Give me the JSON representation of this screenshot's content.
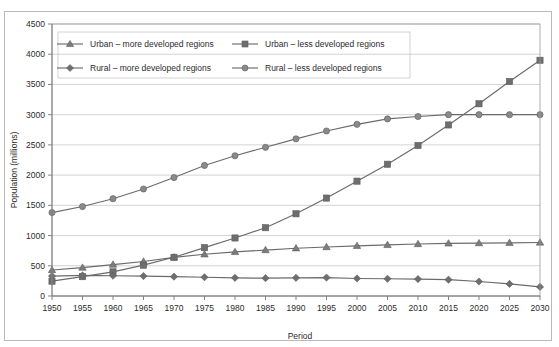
{
  "chart_data": {
    "type": "line",
    "title": "",
    "xlabel": "Period",
    "ylabel": "Population (millions)",
    "x": [
      1950,
      1955,
      1960,
      1965,
      1970,
      1975,
      1980,
      1985,
      1990,
      1995,
      2000,
      2005,
      2010,
      2015,
      2020,
      2025,
      2030
    ],
    "xticklabels": [
      "1950",
      "1955",
      "1960",
      "1965",
      "1970",
      "1975",
      "1980",
      "1985",
      "1990",
      "1995",
      "2000",
      "2005",
      "2010",
      "2015",
      "2020",
      "2025",
      "2030"
    ],
    "yticklabels": [
      "0",
      "500",
      "1000",
      "1500",
      "2000",
      "2500",
      "3000",
      "3500",
      "4000",
      "4500"
    ],
    "yticks": [
      0,
      500,
      1000,
      1500,
      2000,
      2500,
      3000,
      3500,
      4000,
      4500
    ],
    "ylim": [
      0,
      4500
    ],
    "xlim": [
      1950,
      2030
    ],
    "grid": "horizontal",
    "legend_position": "top-left-inside",
    "series": [
      {
        "name": "Urban – more developed regions",
        "marker": "triangle",
        "color": "#7d7d7d",
        "values": [
          430,
          470,
          520,
          570,
          640,
          690,
          730,
          760,
          790,
          810,
          830,
          845,
          860,
          870,
          875,
          880,
          885
        ]
      },
      {
        "name": "Urban – less developed regions",
        "marker": "square",
        "color": "#6e6e6e",
        "values": [
          245,
          320,
          400,
          510,
          640,
          800,
          960,
          1130,
          1360,
          1620,
          1900,
          2180,
          2490,
          2830,
          3180,
          3550,
          3900
        ]
      },
      {
        "name": "Rural – more developed regions",
        "marker": "diamond",
        "color": "#6e6e6e",
        "values": [
          330,
          340,
          335,
          330,
          320,
          310,
          300,
          295,
          300,
          305,
          290,
          285,
          280,
          270,
          240,
          200,
          150
        ]
      },
      {
        "name": "Rural – less developed regions",
        "marker": "circle",
        "color": "#8a8a8a",
        "values": [
          1380,
          1480,
          1610,
          1770,
          1960,
          2160,
          2320,
          2460,
          2600,
          2730,
          2840,
          2930,
          2970,
          3000,
          3000,
          3000,
          3000
        ]
      }
    ]
  },
  "legend": {
    "entries": [
      {
        "label": "Urban – more developed regions",
        "marker": "triangle"
      },
      {
        "label": "Urban – less developed regions",
        "marker": "square"
      },
      {
        "label": "Rural – more developed regions",
        "marker": "diamond"
      },
      {
        "label": "Rural – less developed regions",
        "marker": "circle"
      }
    ]
  },
  "axes": {
    "y_title": "Population (millions)",
    "x_title": "Period"
  }
}
